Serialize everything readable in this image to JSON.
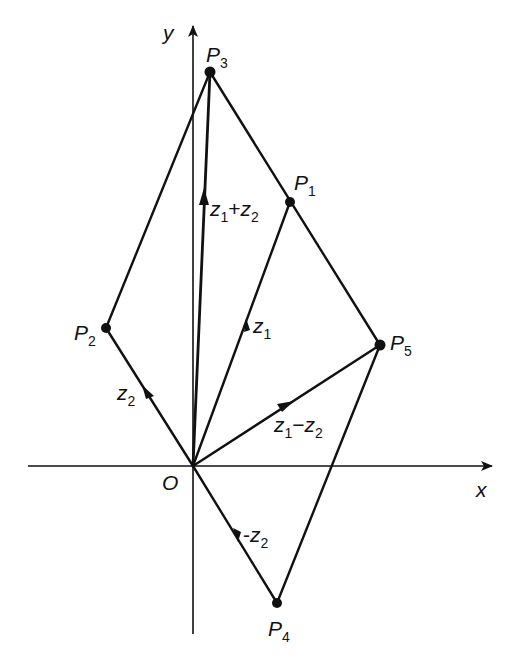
{
  "figure": {
    "axes": {
      "x_label": "x",
      "y_label": "y",
      "origin_label": "O"
    },
    "points": [
      {
        "id": "P1",
        "name": "P",
        "sub": "1"
      },
      {
        "id": "P2",
        "name": "P",
        "sub": "2"
      },
      {
        "id": "P3",
        "name": "P",
        "sub": "3"
      },
      {
        "id": "P4",
        "name": "P",
        "sub": "4"
      },
      {
        "id": "P5",
        "name": "P",
        "sub": "5"
      }
    ],
    "vectors": [
      {
        "id": "z1",
        "label": "z",
        "sub": "1"
      },
      {
        "id": "z2",
        "label": "z",
        "sub": "2"
      },
      {
        "id": "z1_plus_z2",
        "label_a": "z",
        "sub_a": "1",
        "op": "+",
        "label_b": "z",
        "sub_b": "2"
      },
      {
        "id": "z1_minus_z2",
        "label_a": "z",
        "sub_a": "1",
        "op": "−",
        "label_b": "z",
        "sub_b": "2"
      },
      {
        "id": "neg_z2",
        "prefix": "-",
        "label": "z",
        "sub": "2"
      }
    ]
  }
}
